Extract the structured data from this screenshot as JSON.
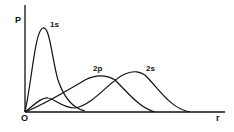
{
  "diagram": {
    "y_axis_label": "P",
    "x_axis_label": "r",
    "origin_label": "O",
    "curves": [
      {
        "name": "1s",
        "label": "1s"
      },
      {
        "name": "2p",
        "label": "2p"
      },
      {
        "name": "2s",
        "label": "2s"
      }
    ]
  }
}
